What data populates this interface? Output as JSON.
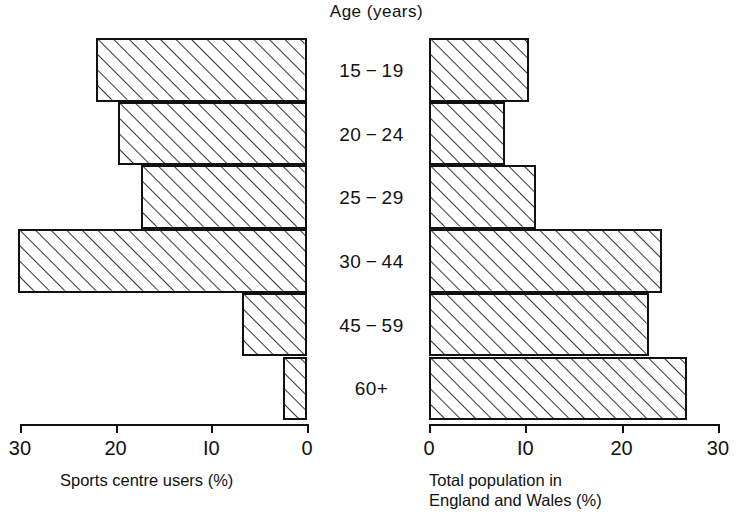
{
  "chart_data": {
    "type": "bar",
    "title": "Age (years)",
    "orientation": "horizontal",
    "layout": "back-to-back population pyramid",
    "categories": [
      "15-19",
      "20-24",
      "25-29",
      "30-44",
      "45-59",
      "60+"
    ],
    "category_axis_label": "Age (years)",
    "grid": false,
    "legend": "none",
    "panels": [
      {
        "name": "left",
        "xlabel": "Sports centre users (%)",
        "direction": "right-to-left",
        "xlim": [
          30,
          0
        ],
        "xticks": [
          30,
          20,
          10,
          0
        ],
        "xtick_labels": [
          "30",
          "20",
          "I0",
          "0"
        ],
        "series": [
          {
            "name": "Sports centre users (%)",
            "values": [
              22.0,
              19.8,
              17.3,
              30.2,
              6.8,
              2.5
            ]
          }
        ]
      },
      {
        "name": "right",
        "xlabel": "Total population in England and Wales (%)",
        "xlabel_line1": "Total population in",
        "xlabel_line2": "England and Wales (%)",
        "direction": "left-to-right",
        "xlim": [
          0,
          30
        ],
        "xticks": [
          0,
          10,
          20,
          30
        ],
        "xtick_labels": [
          "0",
          "I0",
          "20",
          "30"
        ],
        "series": [
          {
            "name": "Total population in England and Wales (%)",
            "values": [
              10.4,
              7.9,
              11.1,
              24.2,
              22.8,
              26.8
            ]
          }
        ]
      }
    ],
    "style": {
      "bar_fill": "hatched diagonal lines",
      "bar_outline": "#111111",
      "background": "#ffffff"
    }
  }
}
